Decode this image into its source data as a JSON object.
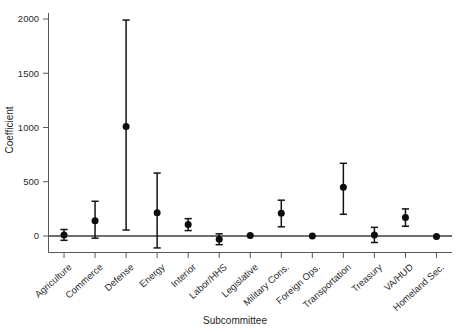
{
  "chart_data": {
    "type": "scatter",
    "title": "",
    "subtitle": "",
    "xlabel": "Subcommittee",
    "ylabel": "Coefficient",
    "grid": false,
    "legend": null,
    "ylim": [
      -160,
      2060
    ],
    "yticks": [
      0,
      500,
      1000,
      1500,
      2000
    ],
    "ytick_labels": [
      "0",
      "500",
      "1000",
      "1500",
      "2000"
    ],
    "error_bar_style": "point-with-capped-interval",
    "reference_line": 0,
    "categories": [
      "Agriculture",
      "Commerce",
      "Defense",
      "Energy",
      "Interior",
      "Labor/HHS",
      "Legislative",
      "Military Cons.",
      "Foreign Ops.",
      "Transportation",
      "Treasury",
      "VA/HUD",
      "Homeland Sec."
    ],
    "values": [
      10,
      140,
      1010,
      215,
      105,
      -30,
      5,
      210,
      0,
      450,
      10,
      170,
      -5
    ],
    "err_low": [
      -40,
      -20,
      55,
      -110,
      50,
      -80,
      5,
      85,
      0,
      200,
      -60,
      90,
      -5
    ],
    "err_high": [
      60,
      320,
      1990,
      580,
      160,
      20,
      5,
      330,
      0,
      670,
      80,
      250,
      -5
    ],
    "points": [
      {
        "category": "Agriculture",
        "value": 10,
        "low": -40,
        "high": 60
      },
      {
        "category": "Commerce",
        "value": 140,
        "low": -20,
        "high": 320
      },
      {
        "category": "Defense",
        "value": 1010,
        "low": 55,
        "high": 1990
      },
      {
        "category": "Energy",
        "value": 215,
        "low": -110,
        "high": 580
      },
      {
        "category": "Interior",
        "value": 105,
        "low": 50,
        "high": 160
      },
      {
        "category": "Labor/HHS",
        "value": -30,
        "low": -80,
        "high": 20
      },
      {
        "category": "Legislative",
        "value": 5,
        "low": 5,
        "high": 5
      },
      {
        "category": "Military Cons.",
        "value": 210,
        "low": 85,
        "high": 330
      },
      {
        "category": "Foreign Ops.",
        "value": 0,
        "low": 0,
        "high": 0
      },
      {
        "category": "Transportation",
        "value": 450,
        "low": 200,
        "high": 670
      },
      {
        "category": "Treasury",
        "value": 10,
        "low": -60,
        "high": 80
      },
      {
        "category": "VA/HUD",
        "value": 170,
        "low": 90,
        "high": 250
      },
      {
        "category": "Homeland Sec.",
        "value": -5,
        "low": -5,
        "high": -5
      }
    ]
  },
  "colors": {
    "point": "#0d0d0d",
    "error_bar": "#141414",
    "axis": "#555a5e",
    "zero_line": "#3b3f42",
    "background": "#ffffff",
    "text": "#2b2b2b"
  }
}
